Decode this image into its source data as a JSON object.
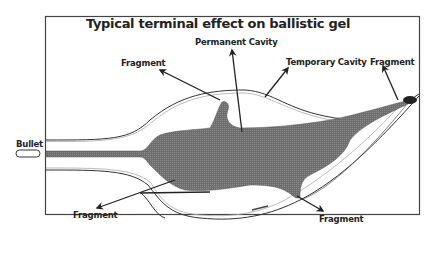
{
  "diagram": {
    "title": "Typical terminal effect on ballistic gel",
    "labels": {
      "permanent_cavity": "Permanent Cavity",
      "temporary_cavity": "Temporary Cavity",
      "fragment_top_left": "Fragment",
      "fragment_top_right": "Fragment",
      "fragment_bottom_left": "Fragment",
      "fragment_bottom_right": "Fragment",
      "bullet": "Bullet"
    },
    "colors": {
      "cavity_fill": "#6e6e6e",
      "outline": "#333333",
      "frame": "#444444"
    }
  }
}
